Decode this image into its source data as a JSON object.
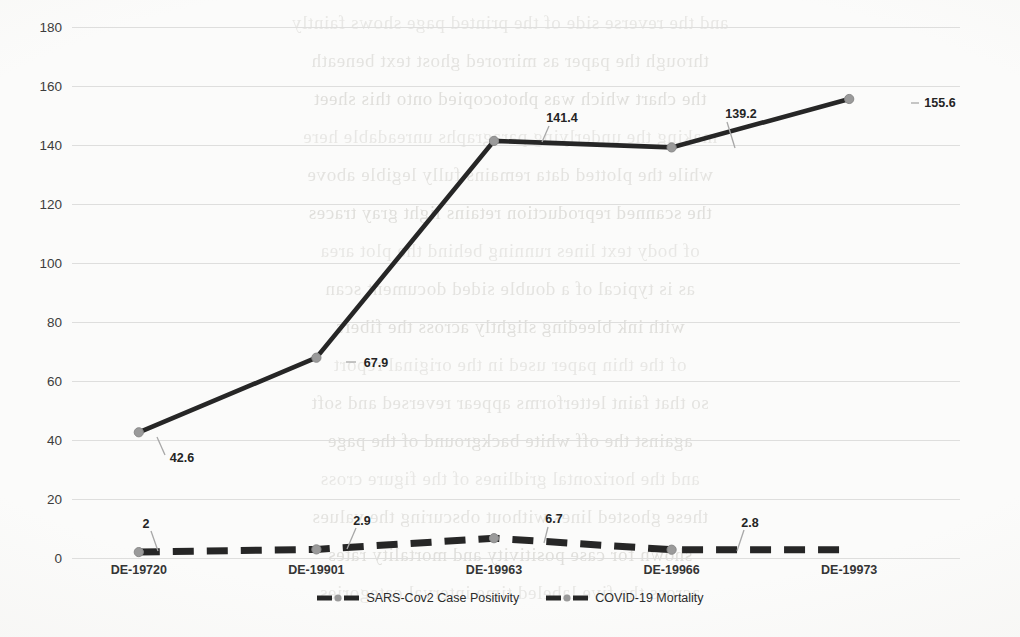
{
  "chart_data": {
    "type": "line",
    "title": "",
    "xlabel": "",
    "ylabel": "",
    "categories": [
      "DE-19720",
      "DE-19901",
      "DE-19963",
      "DE-19966",
      "DE-19973"
    ],
    "ylim": [
      0,
      180
    ],
    "yticks": [
      0,
      20,
      40,
      60,
      80,
      100,
      120,
      140,
      160,
      180
    ],
    "grid": true,
    "legend_position": "bottom",
    "series": [
      {
        "name": "SARS-Cov2 Case Positivity",
        "style": "solid",
        "color": "#262626",
        "values": [
          42.6,
          67.9,
          141.4,
          139.2,
          155.6
        ],
        "labels": [
          "42.6",
          "67.9",
          "141.4",
          "139.2",
          "155.6"
        ]
      },
      {
        "name": "COVID-19 Mortality",
        "style": "dashed",
        "color": "#262626",
        "values": [
          2,
          2.9,
          6.7,
          2.8,
          2.8
        ],
        "labels": [
          "2",
          "2.9",
          "6.7",
          "2.8",
          ""
        ]
      }
    ]
  },
  "axis": {
    "ytick_labels": [
      "180",
      "160",
      "140",
      "120",
      "100",
      "80",
      "60",
      "40",
      "20",
      "0"
    ],
    "xtick_labels": [
      "DE-19720",
      "DE-19901",
      "DE-19963",
      "DE-19966",
      "DE-19973"
    ]
  },
  "legend": {
    "items": [
      {
        "label": "SARS-Cov2 Case Positivity",
        "marker": "line-marker-solid"
      },
      {
        "label": "COVID-19 Mortality",
        "marker": "line-marker-dashed"
      }
    ]
  },
  "data_labels": {
    "positivity": [
      "42.6",
      "67.9",
      "141.4",
      "139.2",
      "155.6"
    ],
    "mortality": [
      "2",
      "2.9",
      "6.7",
      "2.8"
    ]
  },
  "background": {
    "kind": "scanned-page-bleed-through",
    "bleed_lines": [
      "and the reverse side of the printed page shows faintly",
      "through the paper as mirrored ghost text beneath",
      "the chart which was photocopied onto this sheet",
      "making the underlying paragraphs unreadable here",
      "while the plotted data remains fully legible above",
      "the scanned reproduction retains light gray traces",
      "of body text lines running behind the plot area",
      "as is typical of a double sided document scan",
      "with ink bleeding slightly across the fibers",
      "of the thin paper used in the original report",
      "so that faint letterforms appear reversed and soft",
      "against the off white background of the page",
      "and the horizontal gridlines of the figure cross",
      "these ghosted lines without obscuring the values",
      "shown for case positivity and mortality rates",
      "across the five labeled time interval categories"
    ]
  }
}
